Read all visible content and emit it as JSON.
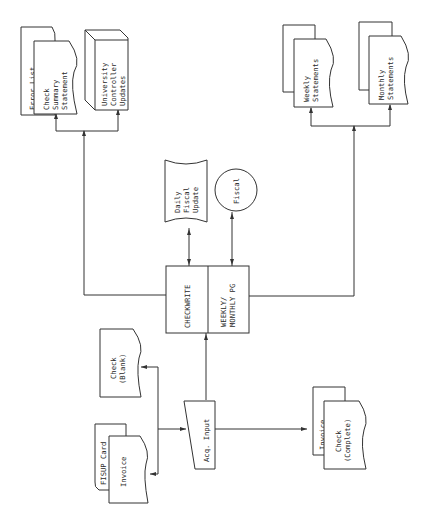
{
  "diagram": {
    "title": "",
    "orientation": "rotated-90-clockwise",
    "nodes": {
      "error_list": {
        "label": "Error List",
        "shape": "document"
      },
      "check_summary": {
        "lines": [
          "Check",
          "Summary",
          "Statement"
        ],
        "shape": "document"
      },
      "univ_controller": {
        "lines": [
          "University",
          "Controller",
          "Updates"
        ],
        "shape": "3d-box"
      },
      "weekly": {
        "lines": [
          "Weekly",
          "Statements"
        ],
        "shape": "multi-document"
      },
      "monthly": {
        "lines": [
          "Monthly",
          "Statements"
        ],
        "shape": "multi-document"
      },
      "daily_fiscal": {
        "lines": [
          "Daily",
          "Fiscal",
          "Update"
        ],
        "shape": "punched-tape"
      },
      "fiscal": {
        "label": "Fiscal",
        "shape": "circle"
      },
      "checkwrite": {
        "label": "CHECKWRITE",
        "shape": "process"
      },
      "weekly_monthly_pg": {
        "lines": [
          "WEEKLY/",
          "MONTHLY PG"
        ],
        "shape": "process"
      },
      "check_blank": {
        "lines": [
          "Check",
          "(Blank)"
        ],
        "shape": "document"
      },
      "fisup_card": {
        "label": "FISUP Card",
        "shape": "card"
      },
      "invoice_in": {
        "label": "Invoice",
        "shape": "document"
      },
      "acq_input": {
        "label": "Acq. Input",
        "shape": "manual-input"
      },
      "invoice_out": {
        "label": "Invoice",
        "shape": "document"
      },
      "check_complete": {
        "lines": [
          "Check",
          "(Complete)"
        ],
        "shape": "document"
      }
    },
    "edges": [
      {
        "from": "check_blank",
        "to": "acq_input"
      },
      {
        "from": "invoice_in",
        "to": "acq_input"
      },
      {
        "from": "acq_input",
        "to": "checkwrite"
      },
      {
        "from": "acq_input",
        "to": "invoice_out"
      },
      {
        "from": "checkwrite",
        "to": "daily_fiscal",
        "bidirectional": true
      },
      {
        "from": "weekly_monthly_pg",
        "to": "fiscal",
        "bidirectional": true
      },
      {
        "from": "checkwrite",
        "to": "check_summary"
      },
      {
        "from": "checkwrite",
        "to": "univ_controller"
      },
      {
        "from": "weekly_monthly_pg",
        "to": "weekly"
      },
      {
        "from": "weekly_monthly_pg",
        "to": "monthly"
      }
    ]
  }
}
